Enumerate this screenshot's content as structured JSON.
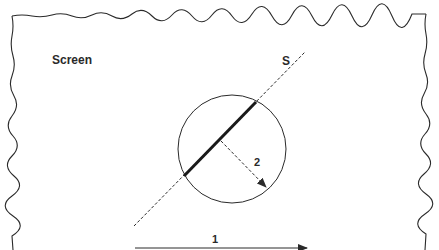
{
  "diagram": {
    "frame_label": "Screen",
    "line_label": "S",
    "arrow_2_label": "2",
    "arrow_1_label": "1"
  },
  "colors": {
    "stroke": "#2a2a2a",
    "background": "#ffffff"
  }
}
